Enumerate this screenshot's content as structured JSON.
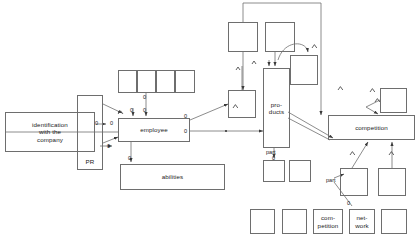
{
  "diagram": {
    "canvas": {
      "width": 420,
      "height": 242
    },
    "stroke_color": "#6e6e6e",
    "text_color": "#1a1a1a",
    "nodes": [
      {
        "id": "identification",
        "label": "identification\nwith the\ncompany",
        "x": 5,
        "y": 112,
        "w": 90,
        "h": 40
      },
      {
        "id": "pr",
        "label": "PR",
        "x": 77,
        "y": 95,
        "w": 26,
        "h": 75
      },
      {
        "id": "employee",
        "label": "employee",
        "x": 118,
        "y": 118,
        "w": 72,
        "h": 24
      },
      {
        "id": "abilities",
        "label": "abilities",
        "x": 120,
        "y": 164,
        "w": 105,
        "h": 26
      },
      {
        "id": "top-strip-1",
        "label": "",
        "x": 118,
        "y": 70,
        "w": 19,
        "h": 23
      },
      {
        "id": "top-strip-2",
        "label": "",
        "x": 137,
        "y": 70,
        "w": 19,
        "h": 23
      },
      {
        "id": "top-strip-3",
        "label": "",
        "x": 156,
        "y": 70,
        "w": 19,
        "h": 23
      },
      {
        "id": "top-strip-4",
        "label": "",
        "x": 175,
        "y": 70,
        "w": 20,
        "h": 23
      },
      {
        "id": "mid-square",
        "label": "",
        "x": 228,
        "y": 90,
        "w": 28,
        "h": 28
      },
      {
        "id": "top-square-left",
        "label": "",
        "x": 228,
        "y": 22,
        "w": 30,
        "h": 30
      },
      {
        "id": "top-square-right",
        "label": "",
        "x": 265,
        "y": 22,
        "w": 30,
        "h": 30
      },
      {
        "id": "products",
        "label": "pro-\nducts",
        "x": 263,
        "y": 68,
        "w": 27,
        "h": 80
      },
      {
        "id": "curve-target-square",
        "label": "",
        "x": 290,
        "y": 55,
        "w": 28,
        "h": 30
      },
      {
        "id": "competition",
        "label": "competition",
        "x": 328,
        "y": 115,
        "w": 87,
        "h": 25
      },
      {
        "id": "right-upper-square",
        "label": "",
        "x": 380,
        "y": 88,
        "w": 27,
        "h": 25
      },
      {
        "id": "part-square-left",
        "label": "",
        "x": 263,
        "y": 160,
        "w": 22,
        "h": 22
      },
      {
        "id": "part-square-right",
        "label": "",
        "x": 289,
        "y": 160,
        "w": 22,
        "h": 22
      },
      {
        "id": "lower-square-a",
        "label": "",
        "x": 340,
        "y": 168,
        "w": 28,
        "h": 28
      },
      {
        "id": "lower-square-b",
        "label": "",
        "x": 378,
        "y": 168,
        "w": 28,
        "h": 28
      },
      {
        "id": "bottom-1",
        "label": "",
        "x": 250,
        "y": 209,
        "w": 25,
        "h": 25
      },
      {
        "id": "bottom-2",
        "label": "",
        "x": 282,
        "y": 209,
        "w": 25,
        "h": 25
      },
      {
        "id": "bottom-competition",
        "label": "com-\npetition",
        "x": 313,
        "y": 209,
        "w": 30,
        "h": 25
      },
      {
        "id": "bottom-network",
        "label": "net-\nwork",
        "x": 349,
        "y": 209,
        "w": 26,
        "h": 25
      },
      {
        "id": "bottom-5",
        "label": "",
        "x": 381,
        "y": 209,
        "w": 26,
        "h": 25
      }
    ],
    "edge_labels": [
      {
        "id": "lbl-zero-pr-upper",
        "text": "0",
        "x": 95,
        "y": 124
      },
      {
        "id": "lbl-zero-pr-emp",
        "text": "0",
        "x": 110,
        "y": 124
      },
      {
        "id": "lbl-zero-emp-top-left",
        "text": "0",
        "x": 133,
        "y": 111
      },
      {
        "id": "lbl-zero-emp-top-mid",
        "text": "0",
        "x": 146,
        "y": 111
      },
      {
        "id": "lbl-zero-strip-down",
        "text": "0",
        "x": 146,
        "y": 97
      },
      {
        "id": "lbl-zero-emp-right-top",
        "text": "0",
        "x": 186,
        "y": 116
      },
      {
        "id": "lbl-zero-emp-right-bot",
        "text": "0",
        "x": 186,
        "y": 131
      },
      {
        "id": "lbl-zero-emp-lower-left",
        "text": "0",
        "x": 110,
        "y": 146
      },
      {
        "id": "lbl-zero-abilities",
        "text": "0",
        "x": 131,
        "y": 158
      },
      {
        "id": "lbl-part-products",
        "text": "part",
        "x": 268,
        "y": 152
      },
      {
        "id": "lbl-zero-part",
        "text": "0",
        "x": 272,
        "y": 160
      },
      {
        "id": "lbl-part-lower",
        "text": "part",
        "x": 330,
        "y": 180
      },
      {
        "id": "lbl-zero-network",
        "text": "0",
        "x": 348,
        "y": 203
      }
    ]
  }
}
